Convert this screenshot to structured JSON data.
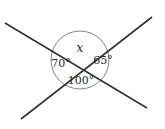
{
  "diagram": {
    "type": "intersecting-lines-angles",
    "intersection": {
      "x": 80,
      "y": 60
    },
    "lines": [
      {
        "id": "line-1",
        "x1": 5,
        "y1": 23,
        "x2": 147,
        "y2": 108
      },
      {
        "id": "line-2",
        "x1": 21,
        "y1": 119,
        "x2": 152,
        "y2": 17
      }
    ],
    "circle": {
      "cx": 80,
      "cy": 60,
      "r": 29
    },
    "labels": {
      "top": "x",
      "left": "70°",
      "right": "65°",
      "bottom": "100°"
    },
    "colors": {
      "line": "#333333",
      "circle": "#555555",
      "text": "#2b2b2b"
    }
  }
}
